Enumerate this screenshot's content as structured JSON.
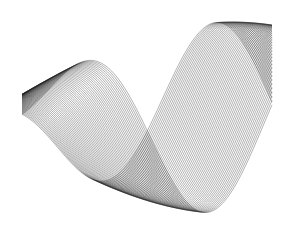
{
  "image": {
    "description": "Abstract monochrome line-art ribbon: a twisted sinusoidal band drawn from many thin stacked curves",
    "background": "#ffffff",
    "stroke_color": "#1a1a1a"
  },
  "ribbon": {
    "x_start": 22,
    "x_end": 272,
    "center_y": 118,
    "amplitude": 96,
    "line_count": 60,
    "twist_span": 0.9
  }
}
